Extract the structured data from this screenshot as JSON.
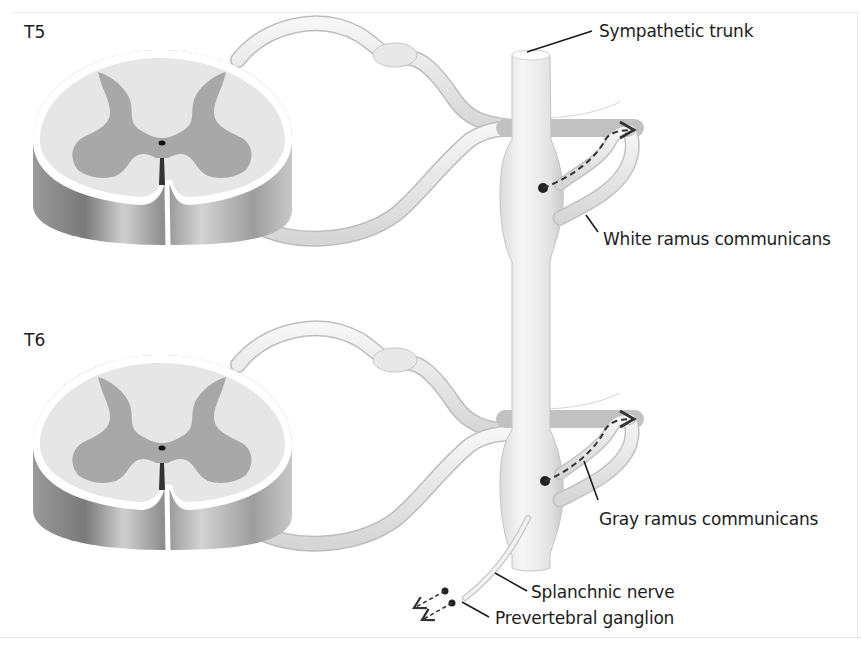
{
  "figure": {
    "segments": [
      {
        "id": "t5",
        "label": "T5"
      },
      {
        "id": "t6",
        "label": "T6"
      }
    ],
    "labels": {
      "sympathetic_trunk": "Sympathetic trunk",
      "white_ramus": "White ramus communicans",
      "gray_ramus": "Gray ramus communicans",
      "splanchnic_nerve": "Splanchnic nerve",
      "prevertebral_ganglion": "Prevertebral ganglion"
    },
    "colors": {
      "white_matter": "#e6e6e6",
      "gray_matter": "#a8a8a8",
      "nerve_fill": "#efefef",
      "nerve_edge": "#b9b9b9",
      "leader_line": "#1c1c1c",
      "pathway_dash": "#333333"
    }
  }
}
